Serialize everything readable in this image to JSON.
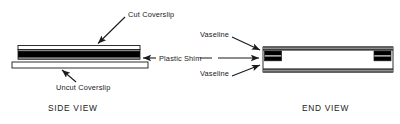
{
  "figure": {
    "title": "",
    "side_view": {
      "caption": "SIDE  VIEW",
      "labels": {
        "cut_coverslip": "Cut  Coverslip",
        "plastic_shim": "Plastic  Shim",
        "uncut_coverslip": "Uncut  Coverslip"
      },
      "parts": [
        {
          "name": "cut-coverslip",
          "role": "thin outlined bar, top layer"
        },
        {
          "name": "plastic-shim",
          "role": "thick black band, middle layer"
        },
        {
          "name": "uncut-coverslip",
          "role": "wide outlined bar, bottom layer"
        }
      ]
    },
    "end_view": {
      "caption": "END  VIEW",
      "labels": {
        "vaseline_top": "Vaseline",
        "vaseline_bottom": "Vaseline",
        "plastic_shim": "Plastic  Shim"
      },
      "parts": [
        {
          "name": "coverslip-top-rail",
          "role": "dark horizontal rail, top"
        },
        {
          "name": "coverslip-bottom-rail",
          "role": "dark horizontal rail, bottom"
        },
        {
          "name": "shim-block-left",
          "role": "dark block at left interior"
        },
        {
          "name": "shim-block-right",
          "role": "dark block at right interior"
        },
        {
          "name": "chamber-cavity",
          "role": "white interior gap"
        }
      ]
    },
    "colors": {
      "ink": "#1a1a1a",
      "fill_black": "#000000",
      "fill_gray": "#808080",
      "fill_white": "#ffffff",
      "background": "#ffffff"
    },
    "annotations": [
      {
        "name": "arrow-cut-coverslip",
        "from": "Cut  Coverslip",
        "to": "cut-coverslip"
      },
      {
        "name": "arrow-plastic-shim-side",
        "from": "Plastic  Shim",
        "to": "plastic-shim"
      },
      {
        "name": "arrow-uncut-coverslip",
        "from": "Uncut  Coverslip",
        "to": "uncut-coverslip"
      },
      {
        "name": "arrow-vaseline-top",
        "from": "Vaseline",
        "to": "shim-block-left"
      },
      {
        "name": "arrow-plastic-shim-end",
        "from": "Plastic  Shim",
        "to": "shim-block-left"
      },
      {
        "name": "arrow-vaseline-bottom",
        "from": "Vaseline",
        "to": "shim-block-left"
      }
    ]
  }
}
